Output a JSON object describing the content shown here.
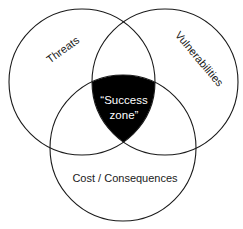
{
  "diagram": {
    "type": "venn",
    "circles": [
      {
        "id": "threats",
        "label": "Threats",
        "cx": 82,
        "cy": 82,
        "r": 73
      },
      {
        "id": "vulnerabilities",
        "label": "Vulnerabilities",
        "cx": 165,
        "cy": 82,
        "r": 73
      },
      {
        "id": "cost",
        "label": "Cost / Consequences",
        "cx": 123,
        "cy": 148,
        "r": 73
      }
    ],
    "intersection": {
      "label_line1": "“Success",
      "label_line2": "zone”",
      "fill": "#000000"
    },
    "colors": {
      "stroke": "#1a1a1a",
      "background": "#ffffff",
      "intersection_text": "#ffffff"
    }
  }
}
